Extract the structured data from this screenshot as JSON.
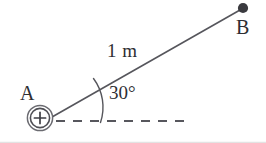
{
  "figure": {
    "type": "physics-diagram",
    "background_color": "#ffffff",
    "stroke_color": "#4a4a50",
    "text_color": "#2e2e33",
    "dot_color": "#3a3a3f",
    "labels": {
      "point_a": "A",
      "point_b": "B",
      "length": "1 m",
      "angle": "30°",
      "charge_sign": "+"
    },
    "geometry": {
      "charge_center": [
        40,
        118
      ],
      "charge_radius": 13,
      "line_start": [
        52,
        117
      ],
      "line_end": [
        240,
        10
      ],
      "point_b": [
        243,
        8
      ],
      "point_b_radius": 5,
      "dashed_line_start": [
        56,
        121
      ],
      "dashed_line_end": [
        192,
        121
      ],
      "angle_arc_start": [
        93,
        78
      ],
      "angle_arc_end": [
        100,
        122
      ],
      "angle_degrees": 30,
      "length_meters": 1
    }
  }
}
